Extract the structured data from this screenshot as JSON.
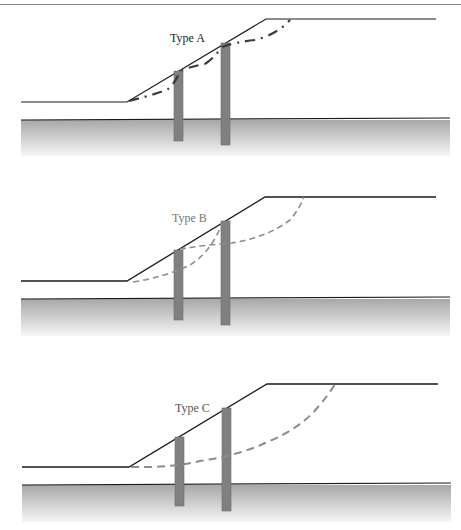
{
  "figure": {
    "colors": {
      "outline": "#1a1a1a",
      "pile": "#808080",
      "pile_edge": "#6b6b6b",
      "slip_a": "#3a3a3a",
      "slip_dashed": "#8c8c8c",
      "ground_top": "#a8a8a8",
      "ground_bottom": "#f6f6f6",
      "label_a": "#222222",
      "label_b": "#777777",
      "label_c": "#555555"
    },
    "panels": [
      {
        "id": "type-a",
        "label": "Type A",
        "slip_style": "dash-dot",
        "description": "Slip surface passes above pile heads (shallow failure between piles)"
      },
      {
        "id": "type-b",
        "label": "Type B",
        "slip_style": "dashed",
        "description": "Slip surfaces pass between the piles, intersecting the upper pile"
      },
      {
        "id": "type-c",
        "label": "Type C",
        "slip_style": "dashed",
        "description": "Deep slip surface passes through both piles"
      }
    ]
  }
}
